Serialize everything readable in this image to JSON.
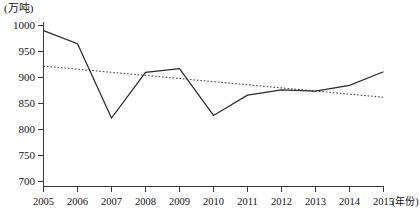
{
  "chart_data": {
    "type": "line",
    "title": "",
    "subtitle": "",
    "xlabel": "(年份)",
    "ylabel": "(万吨)",
    "x": [
      2005,
      2006,
      2007,
      2008,
      2009,
      2010,
      2011,
      2012,
      2013,
      2014,
      2015
    ],
    "categories": [
      "2005",
      "2006",
      "2007",
      "2008",
      "2009",
      "2010",
      "2011",
      "2012",
      "2013",
      "2014",
      "2015"
    ],
    "xlim": [
      2005,
      2015
    ],
    "ylim": [
      700,
      1000
    ],
    "yticks": [
      700,
      750,
      800,
      850,
      900,
      950,
      1000
    ],
    "ytick_labels": [
      "700",
      "750",
      "800",
      "850",
      "900",
      "950",
      "1000"
    ],
    "grid": false,
    "legend": null,
    "legend_position": "none",
    "series": [
      {
        "name": "产量",
        "style": "solid",
        "color": "#2b2b2b",
        "values": [
          990,
          965,
          822,
          910,
          917,
          827,
          866,
          876,
          874,
          885,
          911
        ]
      },
      {
        "name": "线性趋势线",
        "style": "dotted",
        "color": "#4a4a4a",
        "values": [
          922,
          916,
          910,
          904,
          898,
          892,
          886,
          880,
          874,
          868,
          862
        ]
      }
    ],
    "annotations": []
  },
  "axes": {
    "y_unit_label": "(万吨)",
    "x_unit_label": "(年份)"
  }
}
